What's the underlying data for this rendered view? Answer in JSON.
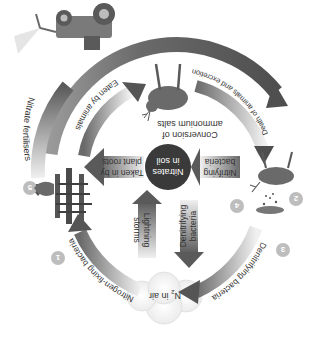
{
  "diagram": {
    "type": "nitrogen-cycle",
    "orientation": "rotated-180",
    "palette": {
      "arrow_dark": "#5a5a5a",
      "arrow_mid": "#8a8a8a",
      "arrow_light": "#e6e6e6",
      "center_circle": "#3a3a3a",
      "badge": "#bdbdbd",
      "cloud": "#f2f2f2",
      "text": "#333333"
    },
    "center": {
      "line1": "Nitrates",
      "line2": "in soil"
    },
    "air": {
      "label_prefix": "N",
      "label_sub": "2",
      "label_suffix": " in air"
    },
    "arrows": {
      "death_of_plants": "Death of plants",
      "eaten_by_animals": "Eaten by animals",
      "nitrate_fertilisers": "Nitrate fertilisers",
      "death_and_excretion": "Death of animals and excretion",
      "conversion_line1": "Conversion of",
      "conversion_line2": "ammonium salts",
      "taken_in_line1": "Taken in by",
      "taken_in_line2": "plant roots",
      "nitrifying_line1": "Nitrifying",
      "nitrifying_line2": "bacteria",
      "denitrifying_inner_line1": "Denitrifying",
      "denitrifying_inner_line2": "bacteria",
      "lightning_line1": "Lightning",
      "lightning_line2": "storms",
      "denitrifying_outer": "Denitrifying bacteria",
      "nitrogen_fixing": "Nitrogen-fixing bacteria"
    },
    "badges": [
      "1",
      "2",
      "3",
      "4",
      "5"
    ],
    "illustrations": [
      "tractor-spraying",
      "deer-dead",
      "ferns-plants",
      "deer-animal",
      "soil-particles",
      "cloud"
    ]
  }
}
